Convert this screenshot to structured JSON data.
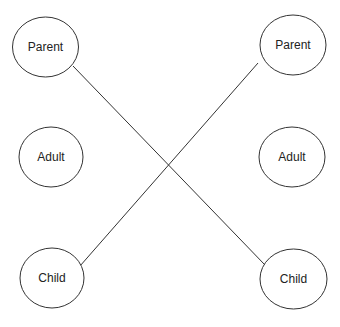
{
  "diagram": {
    "nodes": [
      {
        "id": "left-parent",
        "label": "Parent",
        "cx": 45.5,
        "cy": 47,
        "rx": 33,
        "ry": 30
      },
      {
        "id": "left-adult",
        "label": "Adult",
        "cx": 51,
        "cy": 157,
        "rx": 32,
        "ry": 30
      },
      {
        "id": "left-child",
        "label": "Child",
        "cx": 52,
        "cy": 278,
        "rx": 32,
        "ry": 30
      },
      {
        "id": "right-parent",
        "label": "Parent",
        "cx": 293,
        "cy": 45,
        "rx": 33,
        "ry": 30
      },
      {
        "id": "right-adult",
        "label": "Adult",
        "cx": 292,
        "cy": 157,
        "rx": 33,
        "ry": 30
      },
      {
        "id": "right-child",
        "label": "Child",
        "cx": 293.5,
        "cy": 279,
        "rx": 33.5,
        "ry": 30
      }
    ],
    "edges": [
      {
        "from": "left-parent",
        "to": "right-child",
        "x1": 73,
        "y1": 66,
        "x2": 265,
        "y2": 265
      },
      {
        "from": "left-child",
        "to": "right-parent",
        "x1": 80,
        "y1": 266,
        "x2": 258,
        "y2": 63
      }
    ],
    "colors": {
      "stroke": "#333333",
      "background": "#ffffff",
      "text": "#222222"
    }
  }
}
